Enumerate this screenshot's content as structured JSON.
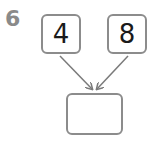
{
  "question": {
    "number": "6"
  },
  "diagram": {
    "type": "number-bond",
    "top_left": {
      "value": "4"
    },
    "top_right": {
      "value": "8"
    },
    "bottom": {
      "value": ""
    },
    "colors": {
      "box_border": "#8c8c8c",
      "arrow": "#7a7a7a",
      "question_number": "#8a8a8a",
      "text": "#1a1a1a"
    }
  }
}
